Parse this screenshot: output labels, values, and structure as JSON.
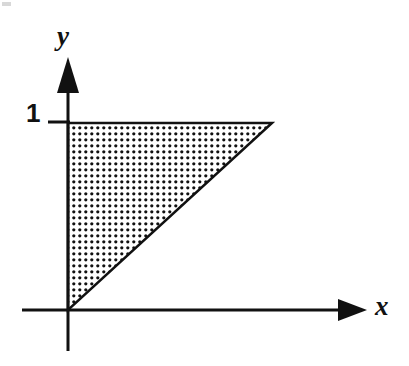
{
  "figure": {
    "background_color": "#ffffff",
    "ink_color": "#111111",
    "width": 409,
    "height": 366
  },
  "axes": {
    "x_axis": {
      "label": "x",
      "icon": "arrow-right-icon",
      "line_y": 310,
      "line_x_start": 22,
      "arrow_tip_x": 367,
      "arrow_base_x": 338,
      "arrow_half_height": 11
    },
    "y_axis": {
      "label": "y",
      "icon": "arrow-up-icon",
      "line_x": 68,
      "line_y_bottom": 351,
      "arrow_tip_y": 57,
      "arrow_base_y": 92,
      "arrow_half_width": 11
    }
  },
  "ticks": [
    {
      "axis": "y",
      "label": "1",
      "value": 1,
      "pixel_y": 122,
      "mark_x_start": 48,
      "mark_x_end": 70
    }
  ],
  "origin": {
    "label": "",
    "pixel_x": 68,
    "pixel_y": 310
  },
  "shaded_region": {
    "name": "dotted-triangle",
    "shape": "right-triangle",
    "fill_style": "stipple-dots",
    "fill_dot_color": "#111111",
    "fill_background_color": "#ffffff",
    "dot_spacing_px": 6,
    "dot_radius_px": 1.6,
    "outline_color": "#111111",
    "outline_width_px": 2.5,
    "vertices_px": [
      {
        "x": 68,
        "y": 310
      },
      {
        "x": 68,
        "y": 123
      },
      {
        "x": 272,
        "y": 123
      }
    ],
    "vertices_data": [
      {
        "x": 0,
        "y": 0
      },
      {
        "x": 0,
        "y": 1
      },
      {
        "x": 1.09,
        "y": 1
      }
    ]
  },
  "chart_data": {
    "type": "area",
    "xlabel": "x",
    "ylabel": "y",
    "grid": false,
    "legend": null,
    "x_ticks": [],
    "y_ticks": [
      "1"
    ],
    "xlim": [
      0,
      1.6
    ],
    "ylim": [
      0,
      1.45
    ],
    "series": [
      {
        "name": "shaded-triangle",
        "fill": "dotted",
        "x": [
          0,
          0,
          1.09
        ],
        "values": [
          0,
          1,
          1
        ]
      }
    ],
    "annotations": [
      {
        "text": "1",
        "x": -0.11,
        "y": 1.0,
        "role": "y-tick-label"
      },
      {
        "text": "x",
        "x": 1.52,
        "y": 0.02,
        "role": "x-axis-label"
      },
      {
        "text": "y",
        "x": -0.06,
        "y": 1.42,
        "role": "y-axis-label"
      }
    ]
  }
}
